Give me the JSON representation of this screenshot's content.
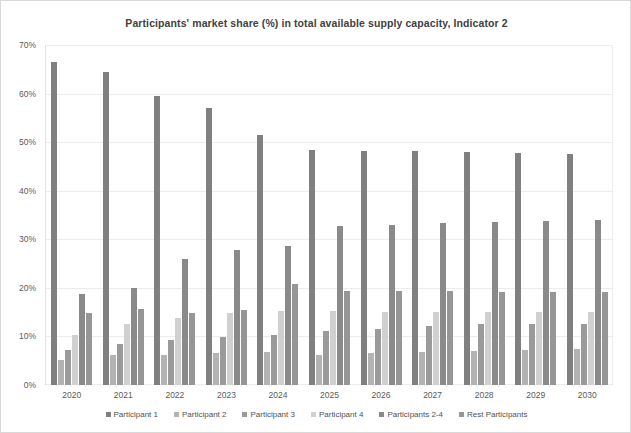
{
  "chart_data": {
    "type": "bar",
    "title": "Participants' market share (%) in total available supply capacity, Indicator 2",
    "xlabel": "",
    "ylabel": "",
    "ylim": [
      0,
      70
    ],
    "ytick_labels": [
      "0%",
      "10%",
      "20%",
      "30%",
      "40%",
      "50%",
      "60%",
      "70%"
    ],
    "ytick_values": [
      0,
      10,
      20,
      30,
      40,
      50,
      60,
      70
    ],
    "grid": true,
    "legend_position": "bottom",
    "categories": [
      "2020",
      "2021",
      "2022",
      "2023",
      "2024",
      "2025",
      "2026",
      "2027",
      "2028",
      "2029",
      "2030"
    ],
    "series": [
      {
        "name": "Participant 1",
        "color": "#808080",
        "values": [
          66.5,
          64.5,
          59.5,
          57.0,
          51.5,
          48.3,
          48.2,
          48.2,
          48.0,
          47.8,
          47.6
        ]
      },
      {
        "name": "Participant 2",
        "color": "#b3b3b3",
        "values": [
          5.2,
          6.2,
          6.2,
          6.5,
          6.8,
          6.2,
          6.5,
          6.8,
          7.1,
          7.3,
          7.5
        ]
      },
      {
        "name": "Participant 3",
        "color": "#9a9a9a",
        "values": [
          7.3,
          8.4,
          9.3,
          9.8,
          10.4,
          11.1,
          11.6,
          12.2,
          12.5,
          12.6,
          12.6
        ]
      },
      {
        "name": "Participant 4",
        "color": "#d0d0d0",
        "values": [
          10.2,
          12.6,
          13.9,
          14.9,
          15.3,
          15.3,
          15.1,
          15.1,
          15.1,
          15.0,
          15.0
        ]
      },
      {
        "name": "Participants 2-4",
        "color": "#8a8a8a",
        "values": [
          18.7,
          19.9,
          26.0,
          27.7,
          28.6,
          32.8,
          33.0,
          33.4,
          33.6,
          33.8,
          34.0
        ]
      },
      {
        "name": "Rest Participants",
        "color": "#969696",
        "values": [
          14.9,
          15.7,
          14.9,
          15.5,
          20.7,
          19.3,
          19.3,
          19.3,
          19.2,
          19.2,
          19.2
        ]
      }
    ]
  },
  "legend": {
    "items": [
      {
        "label": "Participant 1"
      },
      {
        "label": "Participant 2"
      },
      {
        "label": "Participant 3"
      },
      {
        "label": "Participant 4"
      },
      {
        "label": "Participants 2-4"
      },
      {
        "label": "Rest Participants"
      }
    ]
  }
}
